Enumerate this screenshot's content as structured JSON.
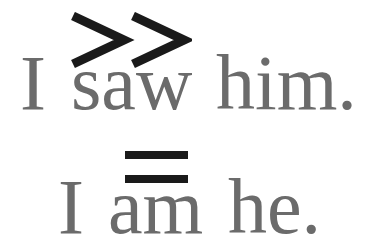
{
  "line1": {
    "words": [
      "I",
      "saw",
      "him."
    ],
    "marker": "double-chevron-right",
    "marker_glyph": ">>"
  },
  "line2": {
    "words": [
      "I",
      "am",
      "he."
    ],
    "marker": "equals",
    "marker_glyph": "="
  },
  "colors": {
    "text": "#6b6b6b",
    "marker": "#1a1a1a",
    "background": "#ffffff"
  }
}
